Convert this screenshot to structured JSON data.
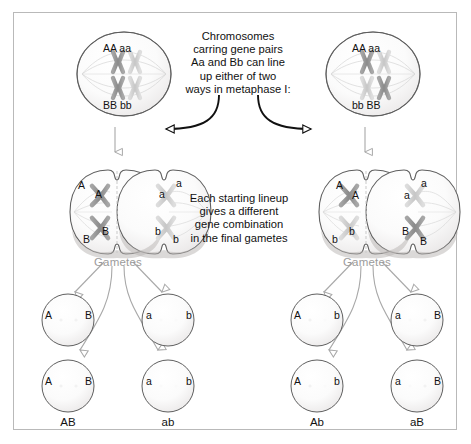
{
  "figure": {
    "frame_color": "#b9b9b9",
    "background": "#ffffff",
    "arrow_gray": "#a8a8a8",
    "arrow_black": "#111111",
    "chromosome_dark": "#8f8f8f",
    "chromosome_light": "#cfcfcf"
  },
  "captions": {
    "top": "Chromosomes\ncarring gene pairs\nAa and Bb can line\nup either of two\nways in metaphase I:",
    "middle": "Each starting lineup\ngives a different\ngene combination\nin the final gametes"
  },
  "labels": {
    "gametes_left": "Gametes",
    "gametes_right": "Gametes"
  },
  "cells": {
    "top_left": {
      "name": "metaphase-I-arrangement-1",
      "top_label": "AA aa",
      "bottom_label": "BB bb"
    },
    "top_right": {
      "name": "metaphase-I-arrangement-2",
      "top_label": "AA aa",
      "bottom_label": "bb BB"
    },
    "mid_left": {
      "name": "anaphase-I-cell-1",
      "top_left": "A",
      "top_left2": "A",
      "top_right": "a",
      "top_right2": "a",
      "bottom_left": "B",
      "bottom_left2": "B",
      "bottom_right": "b",
      "bottom_right2": "b"
    },
    "mid_right": {
      "name": "anaphase-I-cell-2",
      "top_left": "A",
      "top_left2": "A",
      "top_right": "a",
      "top_right2": "a",
      "bottom_left": "b",
      "bottom_left2": "b",
      "bottom_right": "B",
      "bottom_right2": "B"
    }
  },
  "gametes": {
    "left_group": [
      {
        "name": "gamete-AB-upper",
        "allele_left": "A",
        "allele_right": "B",
        "caption": ""
      },
      {
        "name": "gamete-ab-upper",
        "allele_left": "a",
        "allele_right": "b",
        "caption": ""
      },
      {
        "name": "gamete-AB-lower",
        "allele_left": "A",
        "allele_right": "B",
        "caption": "AB"
      },
      {
        "name": "gamete-ab-lower",
        "allele_left": "a",
        "allele_right": "b",
        "caption": "ab"
      }
    ],
    "right_group": [
      {
        "name": "gamete-Ab-upper",
        "allele_left": "A",
        "allele_right": "b",
        "caption": ""
      },
      {
        "name": "gamete-aB-upper",
        "allele_left": "a",
        "allele_right": "B",
        "caption": ""
      },
      {
        "name": "gamete-Ab-lower",
        "allele_left": "A",
        "allele_right": "b",
        "caption": "Ab"
      },
      {
        "name": "gamete-aB-lower",
        "allele_left": "a",
        "allele_right": "B",
        "caption": "aB"
      }
    ]
  },
  "arrows": {
    "branch_left": "curved-black-arrow-left",
    "branch_right": "curved-black-arrow-right",
    "meiosis_left": "gray-arrow-down-left",
    "meiosis_right": "gray-arrow-down-right"
  }
}
